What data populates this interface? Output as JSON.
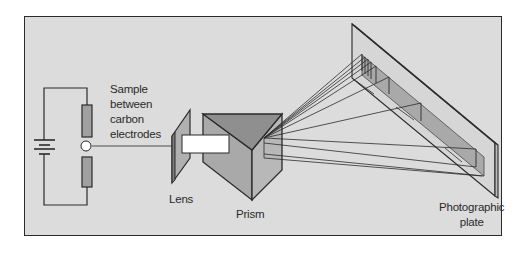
{
  "diagram": {
    "type": "emission spectroscope schematic",
    "components": [
      {
        "id": "battery",
        "name": "Power source"
      },
      {
        "id": "sample",
        "name": "Sample between carbon electrodes"
      },
      {
        "id": "lens",
        "name": "Lens"
      },
      {
        "id": "slit",
        "name": "Slit"
      },
      {
        "id": "prism",
        "name": "Prism"
      },
      {
        "id": "plate",
        "name": "Photographic plate"
      }
    ],
    "labels": {
      "sample": [
        "Sample",
        "between",
        "carbon",
        "electrodes"
      ],
      "lens": "Lens",
      "prism": "Prism",
      "plate": [
        "Photographic",
        "plate"
      ]
    },
    "colors": {
      "background": "#dcdcdc",
      "frame_border": "#2b2b2b",
      "line": "#2b2b2b",
      "prism_top": "#8f8f8f",
      "prism_left": "#a9a9a9",
      "prism_right": "#b8b8b8",
      "spectrum_band": "#9a9a9a",
      "slit": "#ffffff",
      "electrode": "#a0a0a0"
    }
  }
}
